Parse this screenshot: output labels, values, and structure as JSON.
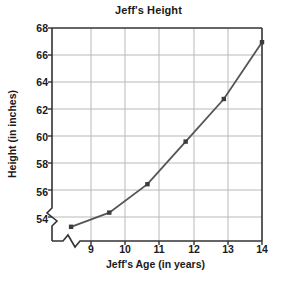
{
  "chart_data": {
    "type": "line",
    "title": "Jeff's Height",
    "xlabel": "Jeff's Age (in years)",
    "ylabel": "Height (in inches)",
    "x": [
      9,
      10,
      11,
      12,
      13,
      14
    ],
    "values": [
      54,
      55,
      57,
      60,
      63,
      67
    ],
    "series": [
      {
        "name": "Jeff's Height",
        "values": [
          54,
          55,
          57,
          60,
          63,
          67
        ]
      }
    ],
    "points": [
      {
        "x": 9,
        "y": 54
      },
      {
        "x": 10,
        "y": 55
      },
      {
        "x": 11,
        "y": 57
      },
      {
        "x": 12,
        "y": 60
      },
      {
        "x": 13,
        "y": 63
      },
      {
        "x": 14,
        "y": 67
      }
    ],
    "xtick_labels": [
      "9",
      "10",
      "11",
      "12",
      "13",
      "14"
    ],
    "ytick_labels": [
      "54",
      "56",
      "58",
      "60",
      "62",
      "64",
      "66",
      "68"
    ],
    "xlim": [
      8.5,
      14
    ],
    "ylim": [
      53,
      68
    ],
    "grid": true,
    "legend": "none",
    "axis_break_x": true,
    "axis_break_y": true,
    "marker": "square",
    "colors": {
      "line": "#555555",
      "marker": "#3c3c3c",
      "grid": "#b9b9b9",
      "axis": "#333333",
      "text": "#1a1a1a",
      "background": "#ffffff"
    }
  }
}
